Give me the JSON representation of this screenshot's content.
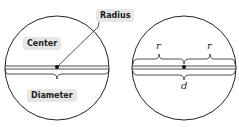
{
  "left_diagram": {
    "labels": {
      "center": "Center",
      "radius": "Radius",
      "diameter": "Diameter"
    }
  },
  "right_diagram": {
    "labels": {
      "r_left": "r",
      "r_right": "r",
      "d": "d"
    }
  },
  "colors": {
    "stroke": "#222222",
    "label_bg": "#e6e6e6"
  }
}
